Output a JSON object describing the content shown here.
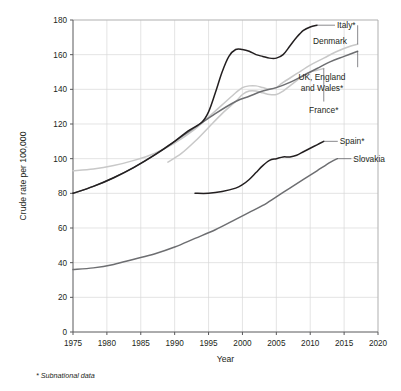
{
  "chart_data": {
    "type": "line",
    "title": "",
    "xlabel": "Year",
    "ylabel": "Crude rate per 100,000",
    "xlim": [
      1975,
      2020
    ],
    "ylim": [
      0,
      180
    ],
    "xticks": [
      1975,
      1980,
      1985,
      1990,
      1995,
      2000,
      2005,
      2010,
      2015,
      2020
    ],
    "yticks": [
      0,
      20,
      40,
      60,
      80,
      100,
      120,
      140,
      160,
      180
    ],
    "grid": true,
    "legend_position": "inline-right-labels",
    "footnote": "* Subnational data",
    "series": [
      {
        "name": "Italy*",
        "label": "Italy*",
        "color": "#231f20",
        "width": 1.5,
        "x": [
          1975,
          1978,
          1981,
          1984,
          1987,
          1990,
          1992,
          1994,
          1995,
          1996,
          1997,
          1998,
          1999,
          2000,
          2001,
          2002,
          2003,
          2004,
          2005,
          2006,
          2007,
          2008,
          2009,
          2010,
          2011
        ],
        "y": [
          80,
          84,
          89,
          95,
          102,
          110,
          116,
          121,
          127,
          138,
          150,
          159,
          163,
          163,
          162,
          160,
          159,
          158,
          158,
          160,
          165,
          170,
          174,
          176,
          177
        ]
      },
      {
        "name": "Denmark",
        "label": "Denmark",
        "color": "#c8c8c8",
        "width": 1.5,
        "x": [
          1975,
          1978,
          1981,
          1984,
          1987,
          1990,
          1993,
          1995,
          1997,
          1999,
          2000,
          2001,
          2002,
          2003,
          2004,
          2005,
          2006,
          2008,
          2010,
          2012,
          2014,
          2016,
          2017
        ],
        "y": [
          93,
          94,
          96,
          99,
          103,
          109,
          117,
          124,
          131,
          138,
          141,
          142,
          142,
          141,
          140,
          141,
          144,
          149,
          154,
          158,
          162,
          165,
          166
        ]
      },
      {
        "name": "UK, England and Wales*",
        "label": "UK, England and Wales*",
        "color": "#6d6e71",
        "width": 1.5,
        "x": [
          1975,
          1978,
          1981,
          1984,
          1987,
          1990,
          1993,
          1996,
          1999,
          2001,
          2003,
          2005,
          2007,
          2009,
          2011,
          2013,
          2015,
          2017
        ],
        "y": [
          80,
          84,
          89,
          95,
          102,
          110,
          118,
          126,
          133,
          136,
          139,
          141,
          144,
          148,
          152,
          156,
          159,
          162
        ]
      },
      {
        "name": "France*",
        "label": "France*",
        "color": "#c8c8c8",
        "width": 1.5,
        "x": [
          1989,
          1991,
          1993,
          1995,
          1997,
          1999,
          2000,
          2001,
          2002,
          2003,
          2004,
          2005,
          2006,
          2007,
          2008,
          2009,
          2010,
          2011,
          2012
        ],
        "y": [
          98,
          103,
          110,
          118,
          126,
          133,
          137,
          139,
          139,
          138,
          137,
          137,
          139,
          142,
          145,
          148,
          150,
          151,
          152
        ]
      },
      {
        "name": "Spain*",
        "label": "Spain*",
        "color": "#231f20",
        "width": 1.5,
        "x": [
          1993,
          1995,
          1997,
          1999,
          2000,
          2001,
          2002,
          2003,
          2004,
          2005,
          2006,
          2007,
          2008,
          2009,
          2010,
          2011,
          2012
        ],
        "y": [
          80,
          80,
          81,
          83,
          85,
          88,
          92,
          96,
          99,
          100,
          101,
          101,
          102,
          104,
          106,
          108,
          110
        ]
      },
      {
        "name": "Slovakia",
        "label": "Slovakia",
        "color": "#6d6e71",
        "width": 1.5,
        "x": [
          1975,
          1978,
          1981,
          1984,
          1987,
          1990,
          1993,
          1996,
          1999,
          2001,
          2003,
          2005,
          2007,
          2009,
          2011,
          2013,
          2014
        ],
        "y": [
          36,
          37,
          39,
          42,
          45,
          49,
          54,
          59,
          65,
          69,
          73,
          78,
          83,
          88,
          93,
          98,
          100
        ]
      }
    ],
    "annotations": [
      {
        "text": "Italy*",
        "anchor_x": 2011,
        "anchor_y": 177
      },
      {
        "text": "Denmark",
        "anchor_x": 2017,
        "anchor_y": 166
      },
      {
        "text": "UK, England",
        "anchor_x": 2017,
        "anchor_y": 162
      },
      {
        "text": "and Wales*",
        "anchor_x": 2017,
        "anchor_y": 162
      },
      {
        "text": "France*",
        "anchor_x": 2012,
        "anchor_y": 152
      },
      {
        "text": "Spain*",
        "anchor_x": 2012,
        "anchor_y": 110
      },
      {
        "text": "Slovakia",
        "anchor_x": 2014,
        "anchor_y": 100
      }
    ]
  }
}
